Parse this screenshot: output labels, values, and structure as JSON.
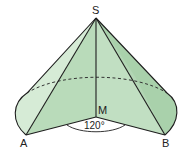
{
  "diagram": {
    "title": "",
    "labels": {
      "apex": "S",
      "center": "M",
      "left_point": "A",
      "right_point": "B",
      "angle": "120°"
    },
    "colors": {
      "face_light": "#cfe6cf",
      "face_mid": "#b5d8b5",
      "face_dark": "#9cc89e",
      "stroke": "#1e1e1e"
    }
  }
}
